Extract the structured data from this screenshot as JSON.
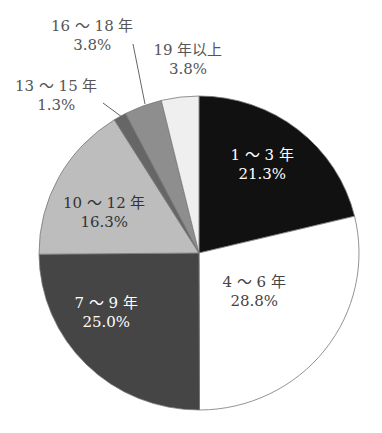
{
  "chart_data": {
    "type": "pie",
    "title": "",
    "start_angle_deg": 0,
    "direction": "clockwise",
    "categories": [
      "1～3年",
      "4～6年",
      "7～9年",
      "10～12年",
      "13～15年",
      "16～18年",
      "19年以上"
    ],
    "values": [
      21.3,
      28.8,
      25.0,
      16.3,
      1.3,
      3.8,
      3.8
    ],
    "unit": "%",
    "colors": [
      "#111111",
      "#ffffff",
      "#454545",
      "#bdbdbd",
      "#666666",
      "#8e8e8e",
      "#efefef"
    ],
    "labels": [
      {
        "name": "1～3年",
        "value": "21.3%",
        "x": 262,
        "y": 165,
        "color": "#ffffff"
      },
      {
        "name": "4～6年",
        "value": "28.8%",
        "x": 254,
        "y": 292,
        "color": "#444444"
      },
      {
        "name": "7～9年",
        "value": "25.0%",
        "x": 106,
        "y": 313,
        "color": "#ffffff"
      },
      {
        "name": "10～12年",
        "value": "16.3%",
        "x": 104,
        "y": 213,
        "color": "#333333"
      },
      {
        "name": "13～15年",
        "value": "1.3%",
        "x": 56,
        "y": 96,
        "color": "#555555"
      },
      {
        "name": "16～18年",
        "value": "3.8%",
        "x": 92,
        "y": 36,
        "color": "#555555"
      },
      {
        "name": "19年以上",
        "value": "3.8%",
        "x": 188,
        "y": 60,
        "color": "#555555"
      }
    ],
    "leaders": [
      {
        "from": [
          103,
          103
        ],
        "to": [
          122,
          117
        ]
      },
      {
        "from": [
          133,
          44
        ],
        "to": [
          145,
          104
        ]
      }
    ],
    "legend": "none"
  }
}
